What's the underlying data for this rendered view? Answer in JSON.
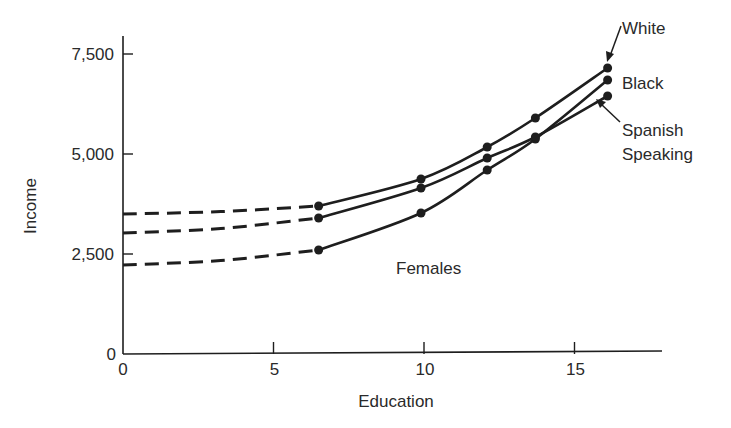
{
  "chart_data": {
    "type": "line",
    "title": "",
    "xlabel": "Education",
    "ylabel": "Income",
    "xlim": [
      0,
      18
    ],
    "ylim": [
      0,
      8000
    ],
    "xticks": [
      0,
      5,
      10,
      15
    ],
    "xtick_labels": [
      "0",
      "5",
      "10",
      "15"
    ],
    "yticks": [
      0,
      2500,
      5000,
      7500
    ],
    "ytick_labels": [
      "0",
      "2,500",
      "5,000",
      "7,500"
    ],
    "grid": false,
    "legend": "inline-labels",
    "annotation": "Females",
    "series": [
      {
        "name": "White",
        "dashed_segment": [
          [
            0,
            3500
          ],
          [
            6.5,
            3700
          ]
        ],
        "points": [
          [
            6.5,
            3700
          ],
          [
            9.9,
            4375
          ],
          [
            12.1,
            5175
          ],
          [
            13.7,
            5900
          ],
          [
            16.1,
            7150
          ]
        ]
      },
      {
        "name": "Black",
        "dashed_segment": [
          [
            0,
            2225
          ],
          [
            6.5,
            2600
          ]
        ],
        "points": [
          [
            6.5,
            2600
          ],
          [
            9.9,
            3525
          ],
          [
            12.1,
            4600
          ],
          [
            13.7,
            5375
          ],
          [
            16.1,
            6850
          ]
        ]
      },
      {
        "name": "Spanish Speaking",
        "dashed_segment": [
          [
            0,
            3025
          ],
          [
            6.5,
            3400
          ]
        ],
        "points": [
          [
            6.5,
            3400
          ],
          [
            9.9,
            4150
          ],
          [
            12.1,
            4900
          ],
          [
            13.7,
            5425
          ],
          [
            16.1,
            6450
          ]
        ]
      }
    ]
  },
  "labels": {
    "white": "White",
    "black": "Black",
    "spanish_line1": "Spanish",
    "spanish_line2": "Speaking",
    "females": "Females",
    "x_axis": "Education",
    "y_axis": "Income",
    "x_origin": "0",
    "y_origin": "0"
  },
  "colors": {
    "ink": "#1e1e1e",
    "background": "#ffffff"
  }
}
